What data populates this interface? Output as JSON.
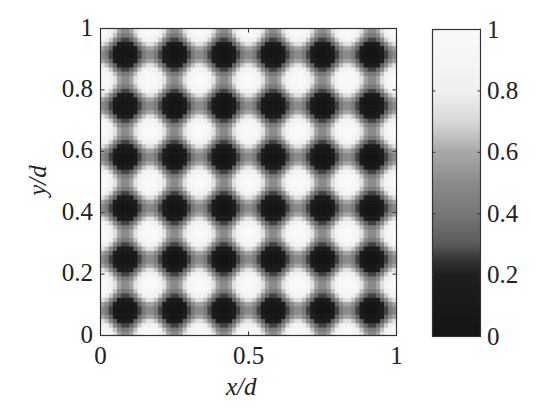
{
  "chart_data": {
    "type": "heatmap",
    "title": "",
    "xlabel": "x/d",
    "ylabel": "y/d",
    "xlim": [
      0,
      1
    ],
    "ylim": [
      0,
      1
    ],
    "xticks": [
      0,
      0.5,
      1
    ],
    "xtick_labels": [
      "0",
      "0.5",
      "1"
    ],
    "yticks": [
      0,
      0.2,
      0.4,
      0.6,
      0.8,
      1
    ],
    "ytick_labels": [
      "0",
      "0.2",
      "0.4",
      "0.6",
      "0.8",
      "1"
    ],
    "grid": false,
    "colorbar": {
      "range": [
        0,
        1
      ],
      "ticks": [
        0,
        0.2,
        0.4,
        0.6,
        0.8,
        1
      ],
      "tick_labels": [
        "0",
        "0.2",
        "0.4",
        "0.6",
        "0.8",
        "1"
      ],
      "position": "right",
      "colormap": [
        [
          0.0,
          "#141414"
        ],
        [
          0.2,
          "#1e1e1e"
        ],
        [
          0.25,
          "#333333"
        ],
        [
          0.3,
          "#5a5a5a"
        ],
        [
          0.4,
          "#777777"
        ],
        [
          0.5,
          "#8a8a8a"
        ],
        [
          0.6,
          "#a8a8a8"
        ],
        [
          0.7,
          "#d8d8d8"
        ],
        [
          0.8,
          "#f0f0f0"
        ],
        [
          1.0,
          "#fafafa"
        ]
      ]
    },
    "field": {
      "description": "Periodic square-lattice intensity pattern; 6 periods per d in x and y. Maxima (≈1) at (m/6, n/6); minima (≈0) at ((2m+1)/12, (2n+1)/12); saddles ≈0.5.",
      "formula": "0.5 + 0.25*(cos(12*pi*x) + cos(12*pi*y))",
      "periods_x": 6,
      "periods_y": 6,
      "resolution": 72
    },
    "minima_positions": {
      "x": [
        0.083,
        0.25,
        0.417,
        0.583,
        0.75,
        0.917
      ],
      "y": [
        0.083,
        0.25,
        0.417,
        0.583,
        0.75,
        0.917
      ],
      "value": 0
    },
    "maxima_positions": {
      "x": [
        0,
        0.167,
        0.333,
        0.5,
        0.667,
        0.833,
        1
      ],
      "y": [
        0,
        0.167,
        0.333,
        0.5,
        0.667,
        0.833,
        1
      ],
      "value": 1
    }
  }
}
